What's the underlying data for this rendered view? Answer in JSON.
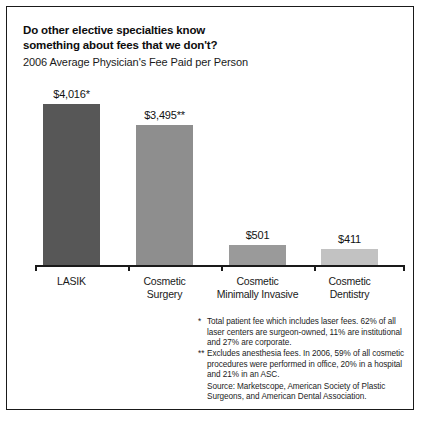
{
  "figure": {
    "title_lines": [
      "Do other elective specialties know",
      "something about fees that we don't?"
    ],
    "subtitle": "2006 Average Physician's Fee Paid per Person"
  },
  "chart_data": {
    "type": "bar",
    "title": "Do other elective specialties know something about fees that we don't?",
    "subtitle": "2006 Average Physician's Fee Paid per Person",
    "xlabel": "",
    "ylabel": "",
    "ylim": [
      0,
      4400
    ],
    "grid": false,
    "legend": "none",
    "categories": [
      "LASIK",
      "Cosmetic Surgery",
      "Cosmetic Minimally Invasive",
      "Cosmetic Dentistry"
    ],
    "category_lines": [
      [
        "LASIK"
      ],
      [
        "Cosmetic",
        "Surgery"
      ],
      [
        "Cosmetic",
        "Minimally Invasive"
      ],
      [
        "Cosmetic",
        "Dentistry"
      ]
    ],
    "values": [
      4016,
      3495,
      501,
      411
    ],
    "data_labels": [
      "$4,016*",
      "$3,495**",
      "$501",
      "$411"
    ],
    "bar_colors": [
      "#575757",
      "#8e8e8e",
      "#9a9a9a",
      "#c2c2c2"
    ]
  },
  "notes": {
    "note1_marker": "*",
    "note1_text": "Total patient fee which includes laser fees. 62% of all laser centers are surgeon-owned, 11% are institutional and 27% are corporate.",
    "note2_marker": "**",
    "note2_text": "Excludes anesthesia fees. In 2006, 59% of all cosmetic procedures were performed in office, 20% in a hospital and 21% in an ASC.",
    "source_text": "Source: Marketscope, American Society of Plastic Surgeons, and American Dental Association."
  }
}
